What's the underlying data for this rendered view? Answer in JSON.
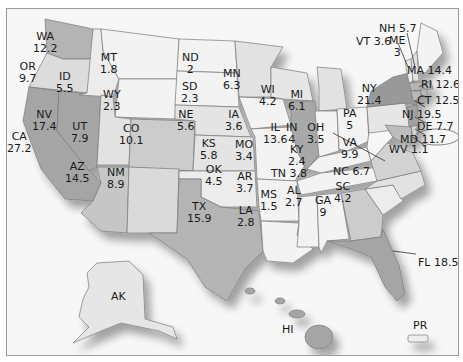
{
  "map": {
    "colors": {
      "background": "#f7f7f7",
      "lowest": "#f2f2f2",
      "low": "#e2e2e2",
      "mid": "#cfcfcf",
      "high": "#a8a8a8",
      "highest": "#8f8f8f",
      "border": "#7a7a7a"
    },
    "states": [
      {
        "abbr": "WA",
        "value": "12.2"
      },
      {
        "abbr": "OR",
        "value": "9.7"
      },
      {
        "abbr": "ID",
        "value": "5.5"
      },
      {
        "abbr": "MT",
        "value": "1.8"
      },
      {
        "abbr": "WY",
        "value": "2.3"
      },
      {
        "abbr": "ND",
        "value": "2"
      },
      {
        "abbr": "SD",
        "value": "2.3"
      },
      {
        "abbr": "NE",
        "value": "5.6"
      },
      {
        "abbr": "MN",
        "value": "6.3"
      },
      {
        "abbr": "WI",
        "value": "4.2"
      },
      {
        "abbr": "MI",
        "value": "6.1"
      },
      {
        "abbr": "IA",
        "value": "3.6"
      },
      {
        "abbr": "IL",
        "value": "13.6"
      },
      {
        "abbr": "IN",
        "value": "4"
      },
      {
        "abbr": "OH",
        "value": "3.5"
      },
      {
        "abbr": "KY",
        "value": "2.4"
      },
      {
        "abbr": "CA",
        "value": "27.2"
      },
      {
        "abbr": "NV",
        "value": "17.4"
      },
      {
        "abbr": "UT",
        "value": "7.9"
      },
      {
        "abbr": "CO",
        "value": "10.1"
      },
      {
        "abbr": "KS",
        "value": "5.8"
      },
      {
        "abbr": "MO",
        "value": "3.4"
      },
      {
        "abbr": "AZ",
        "value": "14.5"
      },
      {
        "abbr": "NM",
        "value": "8.9"
      },
      {
        "abbr": "OK",
        "value": "4.5"
      },
      {
        "abbr": "AR",
        "value": "3.7"
      },
      {
        "abbr": "TX",
        "value": "15.9"
      },
      {
        "abbr": "LA",
        "value": "2.8"
      },
      {
        "abbr": "MS",
        "value": "1.5"
      },
      {
        "abbr": "AL",
        "value": "2.7"
      },
      {
        "abbr": "TN",
        "value": "3.8"
      },
      {
        "abbr": "GA",
        "value": "9"
      },
      {
        "abbr": "SC",
        "value": "4.2"
      },
      {
        "abbr": "NC",
        "value": "6.7"
      },
      {
        "abbr": "VA",
        "value": "9.9"
      },
      {
        "abbr": "WV",
        "value": "1.1"
      },
      {
        "abbr": "MD",
        "value": "11.7"
      },
      {
        "abbr": "DE",
        "value": "7.7"
      },
      {
        "abbr": "NJ",
        "value": "19.5"
      },
      {
        "abbr": "PA",
        "value": "5"
      },
      {
        "abbr": "NY",
        "value": "21.4"
      },
      {
        "abbr": "CT",
        "value": "12.5"
      },
      {
        "abbr": "RI",
        "value": "12.6"
      },
      {
        "abbr": "MA",
        "value": "14.4"
      },
      {
        "abbr": "VT",
        "value": "3.6"
      },
      {
        "abbr": "NH",
        "value": "5.7"
      },
      {
        "abbr": "ME",
        "value": "3"
      },
      {
        "abbr": "FL",
        "value": "18.5"
      },
      {
        "abbr": "AK",
        "value": ""
      },
      {
        "abbr": "HI",
        "value": ""
      },
      {
        "abbr": "PR",
        "value": ""
      }
    ],
    "labels": {
      "WA": "WA\n12.2",
      "OR": "OR\n9.7",
      "ID": "ID\n5.5",
      "MT": "MT\n1.8",
      "WY": "WY\n2.3",
      "ND": "ND\n2",
      "SD": "SD\n2.3",
      "NE": "NE\n5.6",
      "MN": "MN\n6.3",
      "WI": "WI\n4.2",
      "MI": "MI\n6.1",
      "IA": "IA\n3.6",
      "IL": "IL\n13.6",
      "IN": "IN\n4",
      "OH": "OH\n3.5",
      "KY": "KY\n2.4",
      "CA": "CA\n27.2",
      "NV": "NV\n17.4",
      "UT": "UT\n7.9",
      "CO": "CO\n10.1",
      "KS": "KS\n5.8",
      "MO": "MO\n3.4",
      "AZ": "AZ\n14.5",
      "NM": "NM\n8.9",
      "OK": "OK\n4.5",
      "AR": "AR\n3.7",
      "TX": "TX\n15.9",
      "LA": "LA\n2.8",
      "MS": "MS\n1.5",
      "AL": "AL\n2.7",
      "TN": "TN 3.8",
      "GA": "GA\n9",
      "SC": "SC\n4.2",
      "NC": "NC 6.7",
      "VA": "VA\n9.9",
      "WV": "WV 1.1",
      "MD": "MD 11.7",
      "DE": "DE 7.7",
      "NJ": "NJ 19.5",
      "PA": "PA\n5",
      "NY": "NY\n21.4",
      "CT": "CT 12.5",
      "RI": "RI 12.6",
      "MA": "MA 14.4",
      "VT": "VT 3.6",
      "NH": "NH 5.7",
      "ME": "ME\n3",
      "FL": "FL 18.5",
      "AK": "AK",
      "HI": "HI",
      "PR": "PR"
    }
  }
}
